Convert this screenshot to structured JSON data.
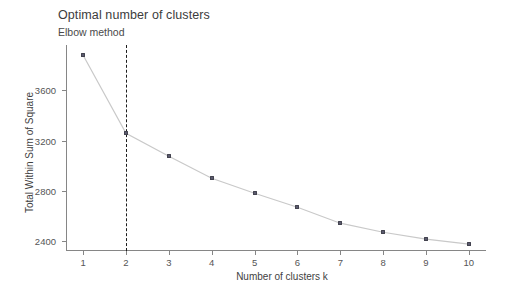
{
  "chart_data": {
    "type": "line",
    "title": "Optimal number of clusters",
    "subtitle": "Elbow method",
    "xlabel": "Number of clusters k",
    "ylabel": "Total Within Sum of Square",
    "x": [
      1,
      2,
      3,
      4,
      5,
      6,
      7,
      8,
      9,
      10
    ],
    "values": [
      3878,
      3258,
      3075,
      2900,
      2781,
      2670,
      2543,
      2471,
      2416,
      2376
    ],
    "xtick_labels": [
      "1",
      "2",
      "3",
      "4",
      "5",
      "6",
      "7",
      "8",
      "9",
      "10"
    ],
    "ytick_labels": [
      "2400",
      "2800",
      "3200",
      "3600"
    ],
    "ytick_values": [
      2400,
      2800,
      3200,
      3600
    ],
    "xlim": [
      0.6,
      10.4
    ],
    "ylim": [
      2330,
      3960
    ],
    "grid": false,
    "legend": false,
    "annotations": [
      {
        "name": "elbow-vertical-line",
        "type": "vline",
        "x": 2,
        "style": "dashed",
        "color": "#1c1c1c"
      }
    ],
    "series_color": "#c9c9c9",
    "marker_color": "#5a5a6e",
    "axis_color": "#868686",
    "text_color": "#3f3f3f"
  }
}
